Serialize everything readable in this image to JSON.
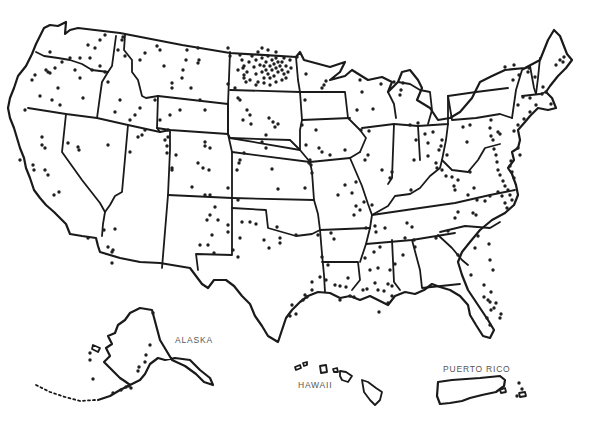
{
  "map": {
    "type": "us-dot-distribution",
    "style": {
      "stroke": "#1a1a1a",
      "dot": "#1f1f1f",
      "label": "#555555",
      "background": "#ffffff"
    },
    "labels": {
      "alaska": "ALASKA",
      "hawaii": "HAWAII",
      "puerto_rico": "PUERTO RICO"
    },
    "dots": [
      [
        105,
        35
      ],
      [
        123,
        37
      ],
      [
        122,
        40
      ],
      [
        118,
        50
      ],
      [
        125,
        56
      ],
      [
        140,
        60
      ],
      [
        145,
        53
      ],
      [
        157,
        46
      ],
      [
        160,
        50
      ],
      [
        187,
        50
      ],
      [
        198,
        48
      ],
      [
        186,
        60
      ],
      [
        183,
        70
      ],
      [
        182,
        78
      ],
      [
        164,
        66
      ],
      [
        172,
        88
      ],
      [
        172,
        83
      ],
      [
        191,
        88
      ],
      [
        198,
        63
      ],
      [
        199,
        60
      ],
      [
        228,
        48
      ],
      [
        230,
        56
      ],
      [
        243,
        68
      ],
      [
        244,
        78
      ],
      [
        235,
        88
      ],
      [
        228,
        84
      ],
      [
        238,
        98
      ],
      [
        247,
        110
      ],
      [
        205,
        110
      ],
      [
        200,
        100
      ],
      [
        180,
        110
      ],
      [
        170,
        115
      ],
      [
        100,
        40
      ],
      [
        95,
        48
      ],
      [
        88,
        45
      ],
      [
        80,
        58
      ],
      [
        90,
        58
      ],
      [
        92,
        70
      ],
      [
        100,
        66
      ],
      [
        70,
        58
      ],
      [
        75,
        70
      ],
      [
        55,
        68
      ],
      [
        62,
        62
      ],
      [
        48,
        72
      ],
      [
        50,
        52
      ],
      [
        46,
        70
      ],
      [
        35,
        75
      ],
      [
        32,
        80
      ],
      [
        25,
        110
      ],
      [
        40,
        96
      ],
      [
        52,
        100
      ],
      [
        60,
        105
      ],
      [
        58,
        88
      ],
      [
        50,
        73
      ],
      [
        80,
        78
      ],
      [
        83,
        98
      ],
      [
        105,
        72
      ],
      [
        108,
        82
      ],
      [
        120,
        100
      ],
      [
        115,
        112
      ],
      [
        130,
        120
      ],
      [
        135,
        115
      ],
      [
        140,
        108
      ],
      [
        145,
        130
      ],
      [
        160,
        120
      ],
      [
        165,
        140
      ],
      [
        155,
        100
      ],
      [
        168,
        130
      ],
      [
        167,
        146
      ],
      [
        42,
        137
      ],
      [
        42,
        145
      ],
      [
        45,
        148
      ],
      [
        20,
        160
      ],
      [
        33,
        165
      ],
      [
        34,
        170
      ],
      [
        45,
        170
      ],
      [
        48,
        175
      ],
      [
        54,
        195
      ],
      [
        59,
        192
      ],
      [
        68,
        143
      ],
      [
        78,
        147
      ],
      [
        79,
        150
      ],
      [
        108,
        145
      ],
      [
        130,
        152
      ],
      [
        138,
        137
      ],
      [
        142,
        135
      ],
      [
        168,
        137
      ],
      [
        167,
        153
      ],
      [
        172,
        168
      ],
      [
        172,
        170
      ],
      [
        176,
        155
      ],
      [
        198,
        163
      ],
      [
        205,
        146
      ],
      [
        205,
        142
      ],
      [
        210,
        148
      ],
      [
        244,
        153
      ],
      [
        237,
        170
      ],
      [
        240,
        160
      ],
      [
        205,
        195
      ],
      [
        210,
        195
      ],
      [
        215,
        207
      ],
      [
        207,
        220
      ],
      [
        212,
        235
      ],
      [
        200,
        245
      ],
      [
        228,
        232
      ],
      [
        240,
        238
      ],
      [
        233,
        250
      ],
      [
        238,
        257
      ],
      [
        104,
        230
      ],
      [
        115,
        229
      ],
      [
        88,
        238
      ],
      [
        108,
        247
      ],
      [
        112,
        252
      ],
      [
        113,
        250
      ],
      [
        112,
        263
      ],
      [
        240,
        55
      ],
      [
        242,
        60
      ],
      [
        244,
        66
      ],
      [
        247,
        72
      ],
      [
        249,
        62
      ],
      [
        252,
        56
      ],
      [
        254,
        67
      ],
      [
        256,
        74
      ],
      [
        256,
        60
      ],
      [
        258,
        52
      ],
      [
        260,
        65
      ],
      [
        262,
        72
      ],
      [
        262,
        58
      ],
      [
        264,
        78
      ],
      [
        264,
        66
      ],
      [
        266,
        62
      ],
      [
        266,
        70
      ],
      [
        268,
        74
      ],
      [
        268,
        56
      ],
      [
        270,
        66
      ],
      [
        270,
        78
      ],
      [
        272,
        60
      ],
      [
        272,
        70
      ],
      [
        274,
        64
      ],
      [
        274,
        76
      ],
      [
        276,
        68
      ],
      [
        276,
        58
      ],
      [
        278,
        72
      ],
      [
        278,
        62
      ],
      [
        280,
        66
      ],
      [
        282,
        70
      ],
      [
        282,
        62
      ],
      [
        284,
        74
      ],
      [
        284,
        58
      ],
      [
        286,
        66
      ],
      [
        288,
        72
      ],
      [
        286,
        78
      ],
      [
        250,
        80
      ],
      [
        258,
        82
      ],
      [
        244,
        75
      ],
      [
        290,
        60
      ],
      [
        291,
        68
      ],
      [
        264,
        83
      ],
      [
        270,
        85
      ],
      [
        256,
        85
      ],
      [
        276,
        82
      ],
      [
        246,
        82
      ],
      [
        282,
        80
      ],
      [
        262,
        48
      ],
      [
        268,
        50
      ],
      [
        276,
        52
      ],
      [
        238,
        70
      ],
      [
        240,
        100
      ],
      [
        250,
        115
      ],
      [
        243,
        120
      ],
      [
        269,
        118
      ],
      [
        273,
        122
      ],
      [
        251,
        124
      ],
      [
        275,
        127
      ],
      [
        266,
        135
      ],
      [
        262,
        142
      ],
      [
        266,
        148
      ],
      [
        278,
        124
      ],
      [
        302,
        125
      ],
      [
        306,
        145
      ],
      [
        309,
        163
      ],
      [
        311,
        165
      ],
      [
        272,
        169
      ],
      [
        278,
        189
      ],
      [
        305,
        188
      ],
      [
        228,
        188
      ],
      [
        239,
        163
      ],
      [
        203,
        168
      ],
      [
        209,
        170
      ],
      [
        192,
        187
      ],
      [
        210,
        215
      ],
      [
        218,
        220
      ],
      [
        228,
        225
      ],
      [
        242,
        222
      ],
      [
        250,
        222
      ],
      [
        238,
        200
      ],
      [
        264,
        240
      ],
      [
        269,
        248
      ],
      [
        280,
        243
      ],
      [
        296,
        235
      ],
      [
        277,
        227
      ],
      [
        256,
        224
      ],
      [
        280,
        238
      ],
      [
        208,
        245
      ],
      [
        214,
        253
      ],
      [
        297,
        57
      ],
      [
        306,
        74
      ],
      [
        326,
        81
      ],
      [
        324,
        85
      ],
      [
        322,
        88
      ],
      [
        305,
        100
      ],
      [
        357,
        110
      ],
      [
        373,
        109
      ],
      [
        361,
        130
      ],
      [
        369,
        131
      ],
      [
        360,
        80
      ],
      [
        381,
        84
      ],
      [
        362,
        92
      ],
      [
        316,
        130
      ],
      [
        319,
        148
      ],
      [
        310,
        160
      ],
      [
        322,
        152
      ],
      [
        312,
        173
      ],
      [
        330,
        155
      ],
      [
        345,
        150
      ],
      [
        365,
        160
      ],
      [
        368,
        155
      ],
      [
        382,
        170
      ],
      [
        392,
        172
      ],
      [
        390,
        178
      ],
      [
        356,
        182
      ],
      [
        345,
        185
      ],
      [
        338,
        195
      ],
      [
        352,
        193
      ],
      [
        356,
        206
      ],
      [
        360,
        210
      ],
      [
        364,
        202
      ],
      [
        354,
        215
      ],
      [
        372,
        205
      ],
      [
        375,
        226
      ],
      [
        385,
        228
      ],
      [
        380,
        247
      ],
      [
        366,
        228
      ],
      [
        331,
        233
      ],
      [
        318,
        235
      ],
      [
        334,
        239
      ],
      [
        322,
        257
      ],
      [
        328,
        265
      ],
      [
        312,
        290
      ],
      [
        305,
        295
      ],
      [
        303,
        300
      ],
      [
        292,
        305
      ],
      [
        290,
        316
      ],
      [
        296,
        314
      ],
      [
        307,
        297
      ],
      [
        312,
        282
      ],
      [
        320,
        277
      ],
      [
        326,
        280
      ],
      [
        335,
        285
      ],
      [
        340,
        286
      ],
      [
        346,
        287
      ],
      [
        350,
        296
      ],
      [
        354,
        297
      ],
      [
        363,
        290
      ],
      [
        367,
        289
      ],
      [
        378,
        290
      ],
      [
        384,
        291
      ],
      [
        388,
        284
      ],
      [
        392,
        286
      ],
      [
        375,
        283
      ],
      [
        392,
        296
      ],
      [
        388,
        303
      ],
      [
        379,
        312
      ],
      [
        340,
        300
      ],
      [
        348,
        278
      ],
      [
        365,
        258
      ],
      [
        374,
        252
      ],
      [
        376,
        232
      ],
      [
        370,
        270
      ],
      [
        378,
        268
      ],
      [
        390,
        270
      ],
      [
        395,
        264
      ],
      [
        407,
        223
      ],
      [
        405,
        238
      ],
      [
        412,
        227
      ],
      [
        411,
        190
      ],
      [
        441,
        146
      ],
      [
        442,
        140
      ],
      [
        439,
        150
      ],
      [
        447,
        155
      ],
      [
        414,
        160
      ],
      [
        437,
        168
      ],
      [
        446,
        176
      ],
      [
        452,
        177
      ],
      [
        474,
        188
      ],
      [
        477,
        200
      ],
      [
        473,
        213
      ],
      [
        476,
        215
      ],
      [
        478,
        236
      ],
      [
        458,
        255
      ],
      [
        471,
        275
      ],
      [
        490,
        260
      ],
      [
        475,
        248
      ],
      [
        489,
        244
      ],
      [
        493,
        270
      ],
      [
        484,
        285
      ],
      [
        491,
        292
      ],
      [
        484,
        297
      ],
      [
        488,
        300
      ],
      [
        490,
        302
      ],
      [
        491,
        310
      ],
      [
        487,
        318
      ],
      [
        490,
        325
      ],
      [
        500,
        318
      ],
      [
        501,
        314
      ],
      [
        494,
        308
      ],
      [
        496,
        303
      ],
      [
        403,
        255
      ],
      [
        414,
        240
      ],
      [
        415,
        247
      ],
      [
        436,
        238
      ],
      [
        448,
        231
      ],
      [
        455,
        218
      ],
      [
        458,
        212
      ],
      [
        485,
        201
      ],
      [
        490,
        196
      ],
      [
        498,
        192
      ],
      [
        502,
        196
      ],
      [
        505,
        203
      ],
      [
        507,
        208
      ],
      [
        512,
        200
      ],
      [
        510,
        195
      ],
      [
        508,
        190
      ],
      [
        505,
        186
      ],
      [
        503,
        181
      ],
      [
        500,
        175
      ],
      [
        498,
        170
      ],
      [
        497,
        162
      ],
      [
        496,
        155
      ],
      [
        494,
        149
      ],
      [
        493,
        140
      ],
      [
        491,
        136
      ],
      [
        468,
        195
      ],
      [
        394,
        82
      ],
      [
        401,
        90
      ],
      [
        403,
        83
      ],
      [
        400,
        95
      ],
      [
        418,
        123
      ],
      [
        425,
        134
      ],
      [
        433,
        132
      ],
      [
        416,
        140
      ],
      [
        410,
        125
      ],
      [
        428,
        143
      ],
      [
        428,
        156
      ],
      [
        436,
        163
      ],
      [
        442,
        170
      ],
      [
        467,
        142
      ],
      [
        463,
        127
      ],
      [
        470,
        125
      ],
      [
        491,
        120
      ],
      [
        490,
        128
      ],
      [
        498,
        132
      ],
      [
        500,
        134
      ],
      [
        514,
        131
      ],
      [
        518,
        125
      ],
      [
        524,
        119
      ],
      [
        530,
        112
      ],
      [
        536,
        105
      ],
      [
        530,
        98
      ],
      [
        523,
        97
      ],
      [
        518,
        105
      ],
      [
        513,
        80
      ],
      [
        519,
        75
      ],
      [
        505,
        67
      ],
      [
        514,
        65
      ],
      [
        563,
        62
      ],
      [
        564,
        57
      ],
      [
        560,
        60
      ],
      [
        556,
        65
      ],
      [
        528,
        72
      ],
      [
        529,
        68
      ],
      [
        535,
        77
      ],
      [
        543,
        87
      ],
      [
        546,
        92
      ],
      [
        542,
        94
      ],
      [
        551,
        104
      ],
      [
        518,
        148
      ],
      [
        520,
        155
      ],
      [
        511,
        161
      ],
      [
        510,
        166
      ],
      [
        512,
        172
      ],
      [
        514,
        178
      ],
      [
        470,
        172
      ],
      [
        458,
        180
      ],
      [
        454,
        186
      ],
      [
        455,
        190
      ]
    ],
    "alaska_dots": [
      [
        153,
        313
      ],
      [
        90,
        353
      ],
      [
        90,
        360
      ],
      [
        93,
        379
      ],
      [
        126,
        387
      ],
      [
        131,
        388
      ],
      [
        121,
        390
      ],
      [
        129,
        386
      ],
      [
        139,
        367
      ],
      [
        145,
        362
      ],
      [
        146,
        355
      ],
      [
        150,
        345
      ],
      [
        138,
        371
      ],
      [
        113,
        393
      ]
    ],
    "pr_dots": [
      [
        519,
        383
      ],
      [
        522,
        389
      ],
      [
        517,
        396
      ]
    ]
  }
}
